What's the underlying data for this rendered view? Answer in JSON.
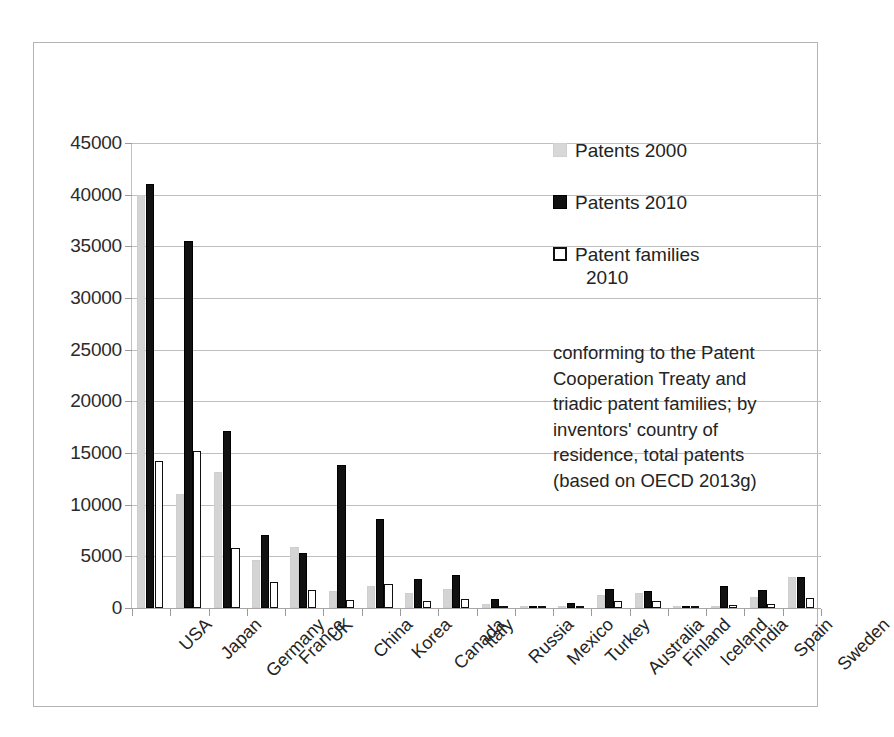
{
  "chart_data": {
    "type": "bar",
    "title": "",
    "xlabel": "",
    "ylabel": "",
    "ylim": [
      0,
      45000
    ],
    "ytick_step": 5000,
    "yticks": [
      "45000",
      "40000",
      "35000",
      "30000",
      "25000",
      "20000",
      "15000",
      "10000",
      "5000",
      "0"
    ],
    "grid": true,
    "legend_position": "inside-upper-right",
    "categories": [
      "USA",
      "Japan",
      "Germany",
      "France",
      "UK",
      "China",
      "Korea",
      "Canada",
      "Italy",
      "Russia",
      "Mexico",
      "Turkey",
      "Australia",
      "Finland",
      "Iceland",
      "India",
      "Spain",
      "Sweden"
    ],
    "series": [
      {
        "name": "Patents 2000",
        "color": "#d4d4d4",
        "values": [
          40000,
          11000,
          13200,
          4600,
          5900,
          1600,
          2100,
          1500,
          1800,
          400,
          100,
          200,
          1300,
          1500,
          100,
          200,
          1100,
          3000
        ]
      },
      {
        "name": "Patents 2010",
        "color": "#111111",
        "values": [
          41000,
          35500,
          17100,
          7100,
          5300,
          13800,
          8600,
          2800,
          3200,
          900,
          200,
          500,
          1800,
          1600,
          150,
          2100,
          1700,
          3000
        ]
      },
      {
        "name": "Patent families 2010",
        "color": "#ffffff",
        "values": [
          14200,
          15200,
          5800,
          2500,
          1700,
          800,
          2300,
          700,
          900,
          150,
          50,
          120,
          650,
          700,
          40,
          300,
          400,
          1000
        ]
      }
    ]
  },
  "legend": {
    "items": [
      {
        "label": "Patents 2000",
        "swatch": "gray-square-icon"
      },
      {
        "label": "Patents 2010",
        "swatch": "black-square-icon"
      },
      {
        "label": "Patent families",
        "label_line2": "2010",
        "swatch": "white-square-icon"
      }
    ]
  },
  "caption": {
    "lines": [
      "conforming to the Patent",
      "Cooperation Treaty and",
      "triadic patent families; by",
      "inventors' country of",
      "residence, total patents",
      "(based on OECD 2013g)"
    ]
  },
  "colors": {
    "series_2000": "#d4d4d4",
    "series_2010": "#111111",
    "series_families_fill": "#ffffff",
    "series_families_stroke": "#101010",
    "gridline": "#bfbfbf",
    "axis": "#a6a6a6",
    "frame": "#b4b4b4",
    "text": "#242424",
    "background": "#ffffff"
  }
}
